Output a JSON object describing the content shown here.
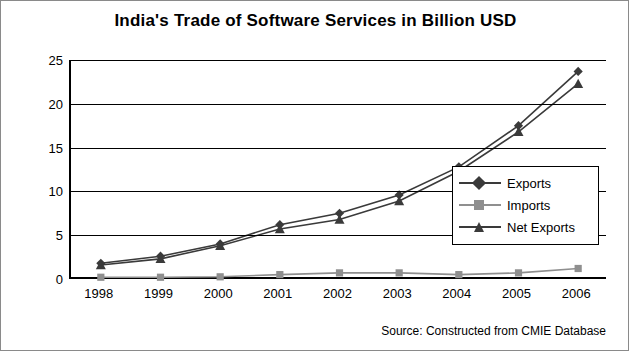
{
  "chart_data": {
    "type": "line",
    "title": "India's Trade of Software Services in Billion USD",
    "xlabel": "",
    "ylabel": "",
    "categories": [
      "1998",
      "1999",
      "2000",
      "2001",
      "2002",
      "2003",
      "2004",
      "2005",
      "2006"
    ],
    "ylim": [
      0,
      25
    ],
    "yticks": [
      0,
      5,
      10,
      15,
      20,
      25
    ],
    "grid": true,
    "legend_position": "inside-right",
    "series": [
      {
        "name": "Exports",
        "marker": "diamond",
        "color": "#3a3a3a",
        "values": [
          1.8,
          2.6,
          4.0,
          6.2,
          7.5,
          9.6,
          12.8,
          17.5,
          23.7
        ]
      },
      {
        "name": "Imports",
        "marker": "square",
        "color": "#8f8f8f",
        "values": [
          0.2,
          0.2,
          0.25,
          0.5,
          0.7,
          0.7,
          0.5,
          0.7,
          1.2
        ]
      },
      {
        "name": "Net Exports",
        "marker": "triangle",
        "color": "#3a3a3a",
        "values": [
          1.6,
          2.3,
          3.8,
          5.7,
          6.8,
          8.9,
          12.3,
          16.8,
          22.3
        ]
      }
    ],
    "annotation": "Source: Constructed from CMIE Database"
  },
  "title": "India's Trade of Software Services in Billion USD",
  "source_note": "Source: Constructed from CMIE Database",
  "legend": {
    "items": [
      {
        "label": "Exports"
      },
      {
        "label": "Imports"
      },
      {
        "label": "Net Exports"
      }
    ]
  },
  "y_axis": {
    "ticks": [
      "25",
      "20",
      "15",
      "10",
      "5",
      "0"
    ]
  },
  "x_axis": {
    "ticks": [
      "1998",
      "1999",
      "2000",
      "2001",
      "2002",
      "2003",
      "2004",
      "2005",
      "2006"
    ]
  }
}
